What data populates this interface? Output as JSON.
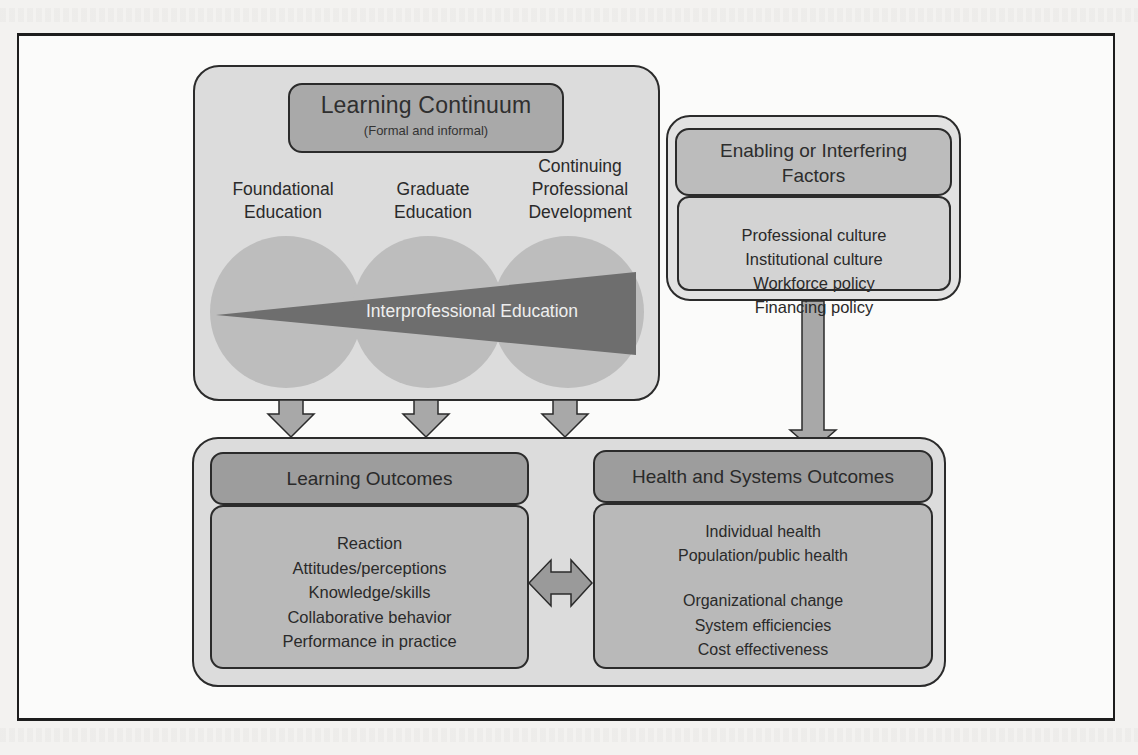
{
  "diagram": {
    "learning_continuum": {
      "title": "Learning Continuum",
      "subtitle": "(Formal and informal)",
      "stages": [
        {
          "lines": [
            "Foundational",
            "Education"
          ]
        },
        {
          "lines": [
            "Graduate",
            "Education"
          ]
        },
        {
          "lines": [
            "Continuing",
            "Professional",
            "Development"
          ]
        }
      ],
      "wedge_label": "Interprofessional Education"
    },
    "enabling_factors": {
      "title_lines": [
        "Enabling or Interfering",
        "Factors"
      ],
      "items": [
        "Professional culture",
        "Institutional culture",
        "Workforce policy",
        "Financing policy"
      ]
    },
    "learning_outcomes": {
      "title": "Learning Outcomes",
      "items": [
        "Reaction",
        "Attitudes/perceptions",
        "Knowledge/skills",
        "Collaborative behavior",
        "Performance in practice"
      ]
    },
    "health_systems_outcomes": {
      "title": "Health and Systems Outcomes",
      "group_1": [
        "Individual health",
        "Population/public health"
      ],
      "group_2": [
        "Organizational change",
        "System efficiencies",
        "Cost effectiveness"
      ]
    },
    "colors": {
      "outer_box": "#dcdcdc",
      "title_box_dark": "#9d9d9d",
      "body_box": "#b9b9b9",
      "circle": "#bdbdbd",
      "wedge": "#6e6e6e",
      "arrow": "#a8a8a8",
      "border": "#2b2b2b"
    }
  }
}
